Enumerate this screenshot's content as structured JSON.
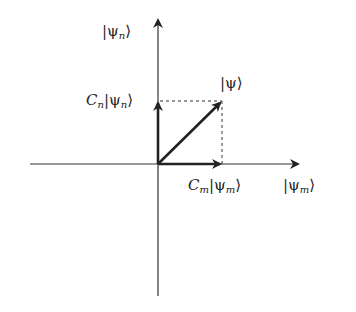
{
  "diagram": {
    "type": "vector-decomposition",
    "colors": {
      "ink": "#222222",
      "background": "#ffffff"
    },
    "origin": [
      158,
      164
    ],
    "axes": {
      "vertical": {
        "label": "|ψn⟩",
        "ket_symbol": "ψ",
        "subscript": "n"
      },
      "horizontal": {
        "label": "|ψm⟩",
        "ket_symbol": "ψ",
        "subscript": "m"
      }
    },
    "vectors": [
      {
        "name": "psi",
        "label": "|ψ⟩",
        "ket_symbol": "ψ",
        "from": [
          158,
          164
        ],
        "to": [
          222,
          101
        ]
      },
      {
        "name": "component-n",
        "label": "Cn|ψn⟩",
        "coef": "C",
        "coef_sub": "n",
        "ket_symbol": "ψ",
        "subscript": "n",
        "from": [
          158,
          164
        ],
        "to": [
          158,
          101
        ]
      },
      {
        "name": "component-m",
        "label": "Cm|ψm⟩",
        "coef": "C",
        "coef_sub": "m",
        "ket_symbol": "ψ",
        "subscript": "m",
        "from": [
          158,
          164
        ],
        "to": [
          222,
          164
        ]
      }
    ],
    "projections": "dashed"
  }
}
